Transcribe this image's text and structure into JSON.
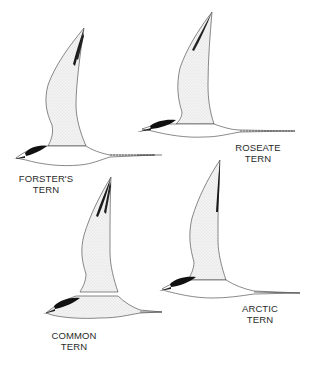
{
  "figure": {
    "background": "#ffffff",
    "ink_color": "#1a1a1a",
    "wing_fill": "#eeeeee",
    "birds": [
      {
        "id": "forsters-tern",
        "label_line1": "FORSTER'S",
        "label_line2": "TERN"
      },
      {
        "id": "roseate-tern",
        "label_line1": "ROSEATE",
        "label_line2": "TERN"
      },
      {
        "id": "common-tern",
        "label_line1": "COMMON",
        "label_line2": "TERN"
      },
      {
        "id": "arctic-tern",
        "label_line1": "ARCTIC",
        "label_line2": "TERN"
      }
    ]
  }
}
